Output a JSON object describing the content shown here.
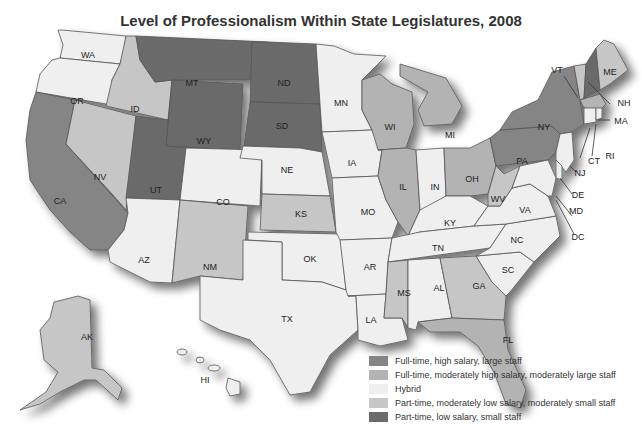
{
  "title": "Level of Professionalism Within State Legislatures, 2008",
  "legend": [
    {
      "key": "fth",
      "label": "Full-time, high salary, large staff",
      "color": "#858585"
    },
    {
      "key": "ftm",
      "label": "Full-time, moderately high salary, moderately large staff",
      "color": "#b3b3b3"
    },
    {
      "key": "hyb",
      "label": "Hybrid",
      "color": "#efefef"
    },
    {
      "key": "ptm",
      "label": "Part-time, moderately low salary, moderately small staff",
      "color": "#c6c6c6"
    },
    {
      "key": "ptl",
      "label": "Part-time, low salary, small staff",
      "color": "#6b6b6b"
    }
  ],
  "states": {
    "WA": {
      "label": "WA",
      "category": "hyb"
    },
    "OR": {
      "label": "OR",
      "category": "hyb"
    },
    "CA": {
      "label": "CA",
      "category": "fth"
    },
    "NV": {
      "label": "NV",
      "category": "ptm"
    },
    "ID": {
      "label": "ID",
      "category": "ptm"
    },
    "MT": {
      "label": "MT",
      "category": "ptl"
    },
    "WY": {
      "label": "WY",
      "category": "ptl"
    },
    "UT": {
      "label": "UT",
      "category": "ptl"
    },
    "AZ": {
      "label": "AZ",
      "category": "hyb"
    },
    "CO": {
      "label": "CO",
      "category": "hyb"
    },
    "NM": {
      "label": "NM",
      "category": "ptm"
    },
    "ND": {
      "label": "ND",
      "category": "ptl"
    },
    "SD": {
      "label": "SD",
      "category": "ptl"
    },
    "NE": {
      "label": "NE",
      "category": "hyb"
    },
    "KS": {
      "label": "KS",
      "category": "ptm"
    },
    "OK": {
      "label": "OK",
      "category": "hyb"
    },
    "TX": {
      "label": "TX",
      "category": "hyb"
    },
    "MN": {
      "label": "MN",
      "category": "hyb"
    },
    "IA": {
      "label": "IA",
      "category": "hyb"
    },
    "MO": {
      "label": "MO",
      "category": "hyb"
    },
    "AR": {
      "label": "AR",
      "category": "hyb"
    },
    "LA": {
      "label": "LA",
      "category": "hyb"
    },
    "WI": {
      "label": "WI",
      "category": "ftm"
    },
    "IL": {
      "label": "IL",
      "category": "ftm"
    },
    "MI": {
      "label": "MI",
      "category": "ftm"
    },
    "IN": {
      "label": "IN",
      "category": "hyb"
    },
    "OH": {
      "label": "OH",
      "category": "ftm"
    },
    "KY": {
      "label": "KY",
      "category": "hyb"
    },
    "TN": {
      "label": "TN",
      "category": "hyb"
    },
    "MS": {
      "label": "MS",
      "category": "ptm"
    },
    "AL": {
      "label": "AL",
      "category": "hyb"
    },
    "GA": {
      "label": "GA",
      "category": "ptm"
    },
    "FL": {
      "label": "FL",
      "category": "ftm"
    },
    "SC": {
      "label": "SC",
      "category": "hyb"
    },
    "NC": {
      "label": "NC",
      "category": "hyb"
    },
    "VA": {
      "label": "VA",
      "category": "hyb"
    },
    "WV": {
      "label": "WV",
      "category": "ptm"
    },
    "PA": {
      "label": "PA",
      "category": "fth"
    },
    "NY": {
      "label": "NY",
      "category": "fth"
    },
    "VT": {
      "label": "VT",
      "category": "ptm"
    },
    "NH": {
      "label": "NH",
      "category": "ptl"
    },
    "ME": {
      "label": "ME",
      "category": "ptm"
    },
    "MA": {
      "label": "MA",
      "category": "ftm"
    },
    "RI": {
      "label": "RI",
      "category": "hyb"
    },
    "CT": {
      "label": "CT",
      "category": "hyb"
    },
    "NJ": {
      "label": "NJ",
      "category": "hyb"
    },
    "DE": {
      "label": "DE",
      "category": "hyb"
    },
    "MD": {
      "label": "MD",
      "category": "hyb"
    },
    "DC": {
      "label": "DC",
      "category": "hyb"
    },
    "AK": {
      "label": "AK",
      "category": "ptm"
    },
    "HI": {
      "label": "HI",
      "category": "hyb"
    }
  }
}
